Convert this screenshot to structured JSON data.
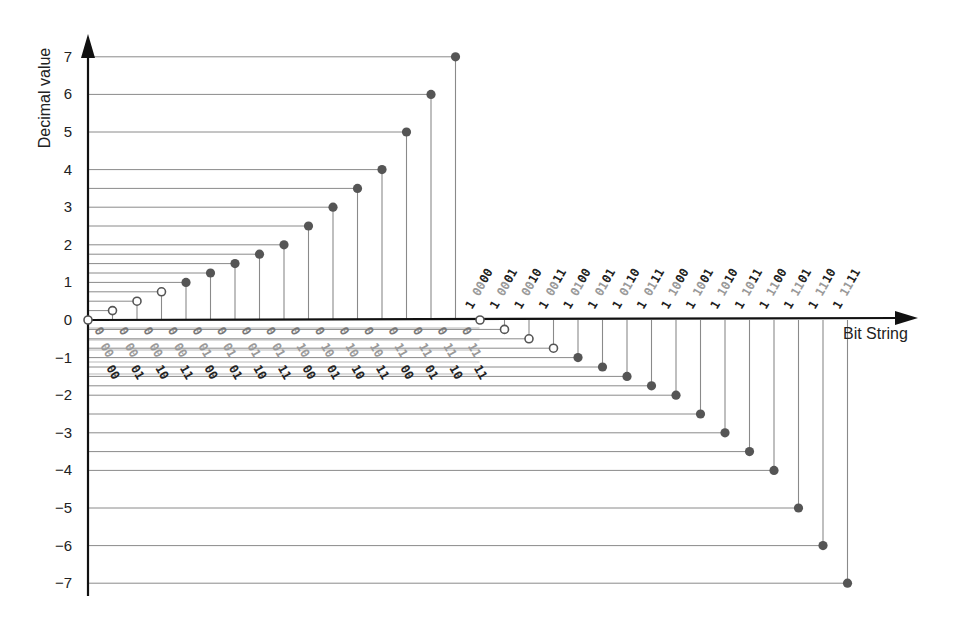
{
  "chart_data": {
    "type": "scatter",
    "subtype": "stem",
    "title": "",
    "xlabel": "Bit String",
    "ylabel": "Decimal value",
    "ylim": [
      -7,
      7
    ],
    "yticks": [
      7,
      6,
      5,
      4,
      3,
      2,
      1,
      0,
      -1,
      -2,
      -3,
      -4,
      -5,
      -6,
      -7
    ],
    "ytick_labels": [
      "7",
      "6",
      "5",
      "4",
      "3",
      "2",
      "1",
      "0",
      "-1",
      "-2",
      "-3",
      "-4",
      "-5",
      "-6",
      "-7"
    ],
    "grid": false,
    "legend": null,
    "marker_legend_note": "hollow markers = denormalized values; filled markers = normalized values",
    "colors": {
      "axis": "#111111",
      "guide_line": "#8a8a8a",
      "marker_fill": "#555555",
      "hollow_marker_stroke": "#555555",
      "label_dark": "#222222",
      "label_mid": "#777777",
      "label_light": "#9a9a9a"
    },
    "points": [
      {
        "bits": "0 00 00",
        "sign": "0",
        "exp": "00",
        "frac": "00",
        "value": 0,
        "hollow": true
      },
      {
        "bits": "0 00 01",
        "sign": "0",
        "exp": "00",
        "frac": "01",
        "value": 0.25,
        "hollow": true
      },
      {
        "bits": "0 00 10",
        "sign": "0",
        "exp": "00",
        "frac": "10",
        "value": 0.5,
        "hollow": true
      },
      {
        "bits": "0 00 11",
        "sign": "0",
        "exp": "00",
        "frac": "11",
        "value": 0.75,
        "hollow": true
      },
      {
        "bits": "0 01 00",
        "sign": "0",
        "exp": "01",
        "frac": "00",
        "value": 1,
        "hollow": false
      },
      {
        "bits": "0 01 01",
        "sign": "0",
        "exp": "01",
        "frac": "01",
        "value": 1.25,
        "hollow": false
      },
      {
        "bits": "0 01 10",
        "sign": "0",
        "exp": "01",
        "frac": "10",
        "value": 1.5,
        "hollow": false
      },
      {
        "bits": "0 01 11",
        "sign": "0",
        "exp": "01",
        "frac": "11",
        "value": 1.75,
        "hollow": false
      },
      {
        "bits": "0 10 00",
        "sign": "0",
        "exp": "10",
        "frac": "00",
        "value": 2,
        "hollow": false
      },
      {
        "bits": "0 10 01",
        "sign": "0",
        "exp": "10",
        "frac": "01",
        "value": 2.5,
        "hollow": false
      },
      {
        "bits": "0 10 10",
        "sign": "0",
        "exp": "10",
        "frac": "10",
        "value": 3,
        "hollow": false
      },
      {
        "bits": "0 10 11",
        "sign": "0",
        "exp": "10",
        "frac": "11",
        "value": 3.5,
        "hollow": false
      },
      {
        "bits": "0 11 00",
        "sign": "0",
        "exp": "11",
        "frac": "00",
        "value": 4,
        "hollow": false
      },
      {
        "bits": "0 11 01",
        "sign": "0",
        "exp": "11",
        "frac": "01",
        "value": 5,
        "hollow": false
      },
      {
        "bits": "0 11 10",
        "sign": "0",
        "exp": "11",
        "frac": "10",
        "value": 6,
        "hollow": false
      },
      {
        "bits": "0 11 11",
        "sign": "0",
        "exp": "11",
        "frac": "11",
        "value": 7,
        "hollow": false
      },
      {
        "bits": "1 00 00",
        "sign": "1",
        "exp": "00",
        "frac": "00",
        "value": 0,
        "hollow": true
      },
      {
        "bits": "1 00 01",
        "sign": "1",
        "exp": "00",
        "frac": "01",
        "value": -0.25,
        "hollow": true
      },
      {
        "bits": "1 00 10",
        "sign": "1",
        "exp": "00",
        "frac": "10",
        "value": -0.5,
        "hollow": true
      },
      {
        "bits": "1 00 11",
        "sign": "1",
        "exp": "00",
        "frac": "11",
        "value": -0.75,
        "hollow": true
      },
      {
        "bits": "1 01 00",
        "sign": "1",
        "exp": "01",
        "frac": "00",
        "value": -1,
        "hollow": false
      },
      {
        "bits": "1 01 01",
        "sign": "1",
        "exp": "01",
        "frac": "01",
        "value": -1.25,
        "hollow": false
      },
      {
        "bits": "1 01 10",
        "sign": "1",
        "exp": "01",
        "frac": "10",
        "value": -1.5,
        "hollow": false
      },
      {
        "bits": "1 01 11",
        "sign": "1",
        "exp": "01",
        "frac": "11",
        "value": -1.75,
        "hollow": false
      },
      {
        "bits": "1 10 00",
        "sign": "1",
        "exp": "10",
        "frac": "00",
        "value": -2,
        "hollow": false
      },
      {
        "bits": "1 10 01",
        "sign": "1",
        "exp": "10",
        "frac": "01",
        "value": -2.5,
        "hollow": false
      },
      {
        "bits": "1 10 10",
        "sign": "1",
        "exp": "10",
        "frac": "10",
        "value": -3,
        "hollow": false
      },
      {
        "bits": "1 10 11",
        "sign": "1",
        "exp": "10",
        "frac": "11",
        "value": -3.5,
        "hollow": false
      },
      {
        "bits": "1 11 00",
        "sign": "1",
        "exp": "11",
        "frac": "00",
        "value": -4,
        "hollow": false
      },
      {
        "bits": "1 11 01",
        "sign": "1",
        "exp": "11",
        "frac": "01",
        "value": -5,
        "hollow": false
      },
      {
        "bits": "1 11 10",
        "sign": "1",
        "exp": "11",
        "frac": "10",
        "value": -6,
        "hollow": false
      },
      {
        "bits": "1 11 11",
        "sign": "1",
        "exp": "11",
        "frac": "11",
        "value": -7,
        "hollow": false
      }
    ],
    "categories": [
      "0 00 00",
      "0 00 01",
      "0 00 10",
      "0 00 11",
      "0 01 00",
      "0 01 01",
      "0 01 10",
      "0 01 11",
      "0 10 00",
      "0 10 01",
      "0 10 10",
      "0 10 11",
      "0 11 00",
      "0 11 01",
      "0 11 10",
      "0 11 11",
      "1 00 00",
      "1 00 01",
      "1 00 10",
      "1 00 11",
      "1 01 00",
      "1 01 01",
      "1 01 10",
      "1 01 11",
      "1 10 00",
      "1 10 01",
      "1 10 10",
      "1 10 11",
      "1 11 00",
      "1 11 01",
      "1 11 10",
      "1 11 11"
    ],
    "values": [
      0,
      0.25,
      0.5,
      0.75,
      1,
      1.25,
      1.5,
      1.75,
      2,
      2.5,
      3,
      3.5,
      4,
      5,
      6,
      7,
      0,
      -0.25,
      -0.5,
      -0.75,
      -1,
      -1.25,
      -1.5,
      -1.75,
      -2,
      -2.5,
      -3,
      -3.5,
      -4,
      -5,
      -6,
      -7
    ]
  }
}
